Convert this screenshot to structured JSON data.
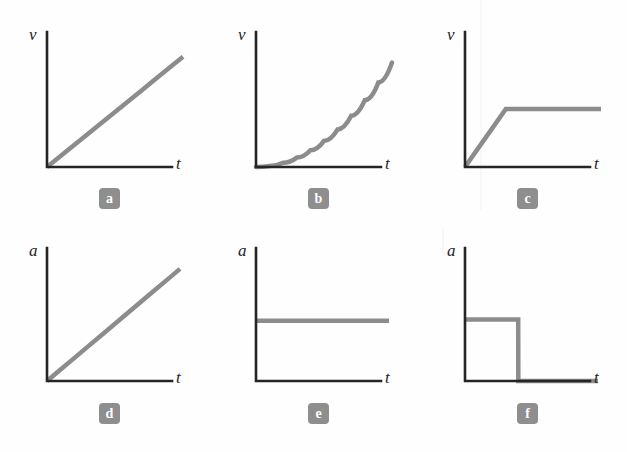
{
  "figure": {
    "background_color": "#fefefe",
    "axis_color": "#252525",
    "curve_color": "#8c8c8c",
    "badge_color": "#8e8e8e",
    "badge_text_color": "#ffffff"
  },
  "chart_data": [
    {
      "type": "line",
      "panel_label": "a",
      "title": "",
      "xlabel": "t",
      "ylabel": "v",
      "xlim": [
        0,
        10
      ],
      "ylim": [
        0,
        10
      ],
      "grid": false,
      "legend": null,
      "description": "velocity increases linearly with time from the origin (constant acceleration)",
      "x": [
        0,
        1,
        2,
        3,
        4,
        5,
        6,
        7,
        8,
        9,
        10
      ],
      "values": [
        0,
        0.95,
        1.9,
        2.85,
        3.8,
        4.75,
        5.7,
        6.65,
        7.6,
        8.55,
        9.5
      ]
    },
    {
      "type": "line",
      "panel_label": "b",
      "title": "",
      "xlabel": "t",
      "ylabel": "v",
      "xlim": [
        0,
        10
      ],
      "ylim": [
        0,
        10
      ],
      "grid": false,
      "legend": null,
      "description": "velocity increases at an increasing rate, concave-up curve from the origin",
      "x": [
        0,
        1,
        2,
        3,
        4,
        5,
        6,
        7,
        8,
        9,
        10
      ],
      "values": [
        0,
        0.09,
        0.36,
        0.81,
        1.44,
        2.25,
        3.24,
        4.41,
        5.76,
        7.29,
        9.0
      ]
    },
    {
      "type": "line",
      "panel_label": "c",
      "title": "",
      "xlabel": "t",
      "ylabel": "v",
      "xlim": [
        0,
        10
      ],
      "ylim": [
        0,
        10
      ],
      "grid": false,
      "legend": null,
      "description": "velocity rises linearly then levels off to a constant plateau",
      "x": [
        0,
        1,
        2,
        3,
        4,
        5,
        6,
        7,
        8,
        9,
        10
      ],
      "values": [
        0,
        1.67,
        3.33,
        5.0,
        5.0,
        5.0,
        5.0,
        5.0,
        5.0,
        5.0,
        5.0
      ]
    },
    {
      "type": "line",
      "panel_label": "d",
      "title": "",
      "xlabel": "t",
      "ylabel": "a",
      "xlim": [
        0,
        10
      ],
      "ylim": [
        0,
        10
      ],
      "grid": false,
      "legend": null,
      "description": "acceleration increases linearly with time from zero",
      "x": [
        0,
        1,
        2,
        3,
        4,
        5,
        6,
        7,
        8,
        9,
        10
      ],
      "values": [
        0,
        0.95,
        1.9,
        2.85,
        3.8,
        4.75,
        5.7,
        6.65,
        7.6,
        8.55,
        9.5
      ]
    },
    {
      "type": "line",
      "panel_label": "e",
      "title": "",
      "xlabel": "t",
      "ylabel": "a",
      "xlim": [
        0,
        10
      ],
      "ylim": [
        0,
        10
      ],
      "grid": false,
      "legend": null,
      "description": "acceleration is constant and non-zero for all time",
      "x": [
        0,
        1,
        2,
        3,
        4,
        5,
        6,
        7,
        8,
        9,
        10
      ],
      "values": [
        5.1,
        5.1,
        5.1,
        5.1,
        5.1,
        5.1,
        5.1,
        5.1,
        5.1,
        5.1,
        5.1
      ]
    },
    {
      "type": "line",
      "panel_label": "f",
      "title": "",
      "xlabel": "t",
      "ylabel": "a",
      "xlim": [
        0,
        10
      ],
      "ylim": [
        0,
        10
      ],
      "grid": false,
      "legend": null,
      "description": "acceleration is constant then drops abruptly to zero (step function)",
      "x": [
        0,
        1,
        2,
        3,
        4,
        4.01,
        5,
        6,
        7,
        8,
        9,
        10
      ],
      "values": [
        5.2,
        5.2,
        5.2,
        5.2,
        5.2,
        0,
        0,
        0,
        0,
        0,
        0,
        0
      ]
    }
  ],
  "panels": [
    {
      "badge": "a",
      "ylabel": "v",
      "xlabel": "t"
    },
    {
      "badge": "b",
      "ylabel": "v",
      "xlabel": "t"
    },
    {
      "badge": "c",
      "ylabel": "v",
      "xlabel": "t"
    },
    {
      "badge": "d",
      "ylabel": "a",
      "xlabel": "t"
    },
    {
      "badge": "e",
      "ylabel": "a",
      "xlabel": "t"
    },
    {
      "badge": "f",
      "ylabel": "a",
      "xlabel": "t"
    }
  ]
}
